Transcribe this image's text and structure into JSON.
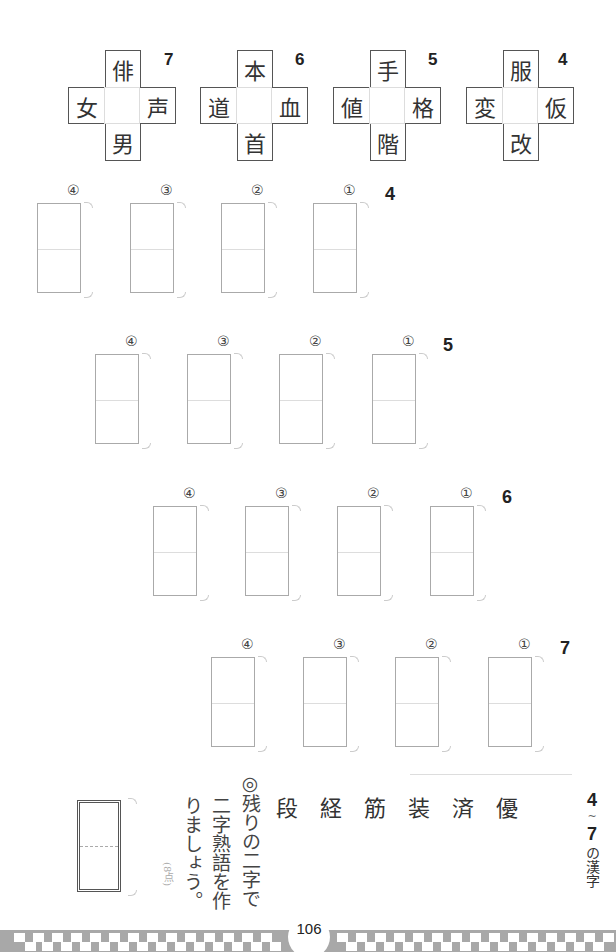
{
  "puzzles": [
    {
      "number": "7",
      "top": "俳",
      "left": "女",
      "right": "声",
      "bottom": "男"
    },
    {
      "number": "6",
      "top": "本",
      "left": "道",
      "right": "血",
      "bottom": "首"
    },
    {
      "number": "5",
      "top": "手",
      "left": "値",
      "right": "格",
      "bottom": "階"
    },
    {
      "number": "4",
      "top": "服",
      "left": "変",
      "right": "仮",
      "bottom": "改"
    }
  ],
  "answer_rows": [
    {
      "number": "4",
      "labels": [
        "④",
        "③",
        "②",
        "①"
      ]
    },
    {
      "number": "5",
      "labels": [
        "④",
        "③",
        "②",
        "①"
      ]
    },
    {
      "number": "6",
      "labels": [
        "④",
        "③",
        "②",
        "①"
      ]
    },
    {
      "number": "7",
      "labels": [
        "④",
        "③",
        "②",
        "①"
      ]
    }
  ],
  "final_section": {
    "title_top": "4",
    "title_tilde": "~",
    "title_bottom": "7",
    "title_text": "の漢字",
    "kanji": [
      "優",
      "済",
      "装",
      "筋",
      "経",
      "段"
    ],
    "instruction_line1": "◎残りの二字で",
    "instruction_line2": "二字熟語を作",
    "instruction_line3": "りましょう。",
    "points": "(8点)"
  },
  "footer": {
    "page_number": "106"
  }
}
